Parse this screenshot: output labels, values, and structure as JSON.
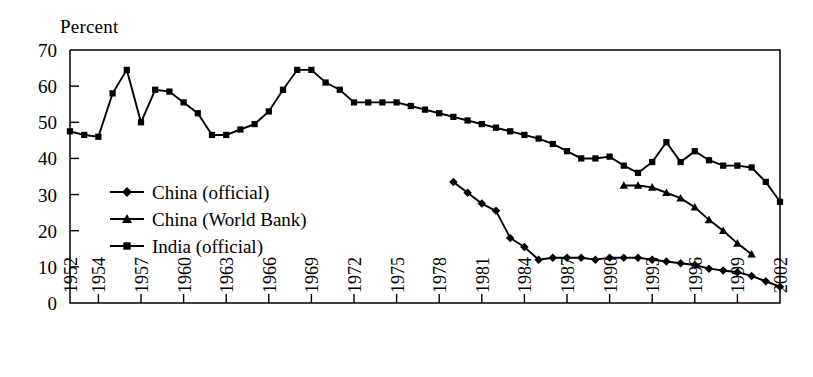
{
  "figure": {
    "axis_label": "Percent",
    "background": "#ffffff",
    "ink_color": "#000000"
  },
  "legend": {
    "position": "inside-left-middle",
    "entries": [
      {
        "label": "China (official)",
        "marker": "diamond-icon"
      },
      {
        "label": "China (World Bank)",
        "marker": "triangle-icon"
      },
      {
        "label": "India (official)",
        "marker": "square-icon"
      }
    ]
  },
  "axes": {
    "y": {
      "label": "Percent",
      "min": 0,
      "max": 70,
      "ticks": [
        0,
        10,
        20,
        30,
        40,
        50,
        60,
        70
      ],
      "tick_labels": [
        "0",
        "10",
        "20",
        "30",
        "40",
        "50",
        "60",
        "70"
      ]
    },
    "x": {
      "min": 1952,
      "max": 2002,
      "ticks": [
        1952,
        1954,
        1957,
        1960,
        1963,
        1966,
        1969,
        1972,
        1975,
        1978,
        1981,
        1984,
        1987,
        1990,
        1993,
        1996,
        1999,
        2002
      ],
      "tick_labels": [
        "1952",
        "1954",
        "1957",
        "1960",
        "1963",
        "1966",
        "1969",
        "1972",
        "1975",
        "1978",
        "1981",
        "1984",
        "1987",
        "1990",
        "1993",
        "1996",
        "1999",
        "2002"
      ],
      "label_orientation": "vertical"
    }
  },
  "chart_data": {
    "type": "line",
    "title": "",
    "subtitle": "",
    "xlabel": "",
    "ylabel": "Percent",
    "xlim": [
      1952,
      2002
    ],
    "ylim": [
      0,
      70
    ],
    "grid": false,
    "legend_position": "inside-left-middle",
    "series": [
      {
        "name": "India (official)",
        "marker": "square",
        "x": [
          1952,
          1953,
          1954,
          1955,
          1956,
          1957,
          1958,
          1959,
          1960,
          1961,
          1962,
          1963,
          1964,
          1965,
          1966,
          1967,
          1968,
          1969,
          1970,
          1971,
          1972,
          1973,
          1974,
          1975,
          1976,
          1977,
          1978,
          1979,
          1980,
          1981,
          1982,
          1983,
          1984,
          1985,
          1986,
          1987,
          1988,
          1989,
          1990,
          1991,
          1992,
          1993,
          1994,
          1995,
          1996,
          1997,
          1998,
          1999,
          2000,
          2001,
          2002
        ],
        "values": [
          47.5,
          46.5,
          46.0,
          58.0,
          64.5,
          50.0,
          59.0,
          58.5,
          55.5,
          52.5,
          46.5,
          46.5,
          48.0,
          49.5,
          53.0,
          59.0,
          64.5,
          64.5,
          61.0,
          59.0,
          55.5,
          55.5,
          55.5,
          55.5,
          54.5,
          53.5,
          52.5,
          51.5,
          50.5,
          49.5,
          48.5,
          47.5,
          46.5,
          45.5,
          44.0,
          42.0,
          40.0,
          40.0,
          40.5,
          38.0,
          36.0,
          39.0,
          44.5,
          39.0,
          42.0,
          39.5,
          38.0,
          38.0,
          37.5,
          33.5,
          28.0
        ]
      },
      {
        "name": "China (official)",
        "marker": "diamond",
        "x": [
          1979,
          1980,
          1981,
          1982,
          1983,
          1984,
          1985,
          1986,
          1987,
          1988,
          1989,
          1990,
          1991,
          1992,
          1993,
          1994,
          1995,
          1996,
          1997,
          1998,
          1999,
          2000,
          2001,
          2002
        ],
        "values": [
          33.5,
          30.5,
          27.5,
          25.5,
          18.0,
          15.5,
          12.0,
          12.5,
          12.5,
          12.5,
          12.0,
          12.5,
          12.5,
          12.5,
          12.0,
          11.5,
          11.0,
          10.5,
          9.5,
          9.0,
          8.5,
          7.5,
          6.0,
          4.5
        ]
      },
      {
        "name": "China (World Bank)",
        "marker": "triangle",
        "x": [
          1991,
          1992,
          1993,
          1994,
          1995,
          1996,
          1997,
          1998,
          1999,
          2000
        ],
        "values": [
          32.5,
          32.5,
          32.0,
          30.5,
          29.0,
          26.5,
          23.0,
          20.0,
          16.5,
          13.5
        ]
      }
    ]
  }
}
